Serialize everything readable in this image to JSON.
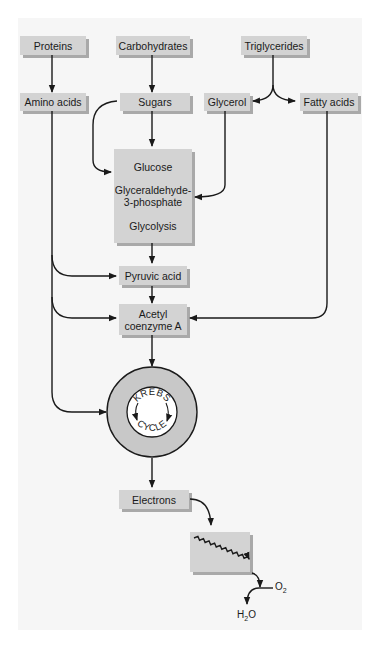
{
  "diagram": {
    "title": "",
    "sources": {
      "proteins": "Proteins",
      "carbohydrates": "Carbohydrates",
      "triglycerides": "Triglycerides"
    },
    "intermediates": {
      "amino_acids": "Amino acids",
      "sugars": "Sugars",
      "glycerol": "Glycerol",
      "fatty_acids": "Fatty acids"
    },
    "glycolysis_box": {
      "line1": "Glucose",
      "line2a": "Glyceraldehyde-",
      "line2b": "3-phosphate",
      "line3": "Glycolysis"
    },
    "pyruvic_acid": "Pyruvic acid",
    "acetyl_coa": {
      "line1": "Acetyl",
      "line2": "coenzyme A"
    },
    "krebs": {
      "top": "KREBS",
      "bottom": "CYCLE"
    },
    "electrons": "Electrons",
    "oxygen": {
      "base": "O",
      "sub": "2"
    },
    "water": {
      "base1": "H",
      "sub": "2",
      "base2": "O"
    },
    "colors": {
      "box": "#d3d3d3",
      "box_shadow": "#a9a9a9",
      "panel": "#f6f6f6",
      "krebs_ring": "#c8c8c8",
      "line": "#1a1a1a"
    }
  }
}
